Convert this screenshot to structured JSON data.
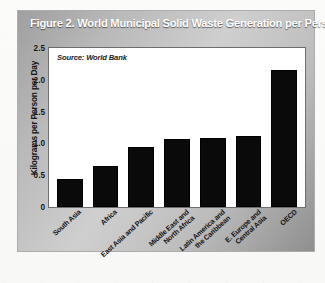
{
  "figure": {
    "title": "Figure 2. World Municipal Solid Waste Generation per Person",
    "source_note": "Source: World Bank"
  },
  "chart_data": {
    "type": "bar",
    "title": "Figure 2. World Municipal Solid Waste Generation per Person",
    "xlabel": "",
    "ylabel": "Kilograms per Person per Day",
    "ylim": [
      0,
      2.5
    ],
    "yticks": [
      "0",
      "0.5",
      "1.0",
      "1.5",
      "2.0",
      "2.5"
    ],
    "ytick_values": [
      0,
      0.5,
      1.0,
      1.5,
      2.0,
      2.5
    ],
    "grid": false,
    "legend": "none",
    "annotations": [
      "Source: World Bank"
    ],
    "bar_color": "#0a0a0a",
    "categories": [
      "South Asia",
      "Africa",
      "East Asia and Pacific",
      "Middle East and\nNorth Africa",
      "Latin America and\nthe Caribbean",
      "E. Europe and\nCentral Asia",
      "OECD"
    ],
    "values": [
      0.44,
      0.65,
      0.95,
      1.07,
      1.09,
      1.11,
      2.15
    ]
  }
}
